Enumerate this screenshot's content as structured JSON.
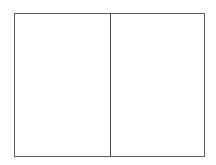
{
  "layout": {
    "type": "two-panel-frame",
    "panels": [
      {
        "id": "left",
        "label": ""
      },
      {
        "id": "right",
        "label": ""
      }
    ]
  },
  "colors": {
    "background": "#ffffff",
    "border": "#5a5a5a",
    "divider": "#4a4a4a"
  }
}
